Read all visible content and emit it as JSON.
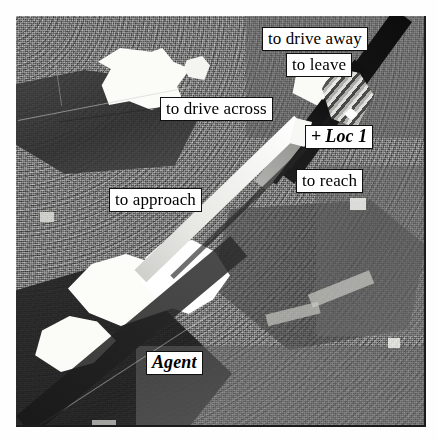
{
  "figure": {
    "kind": "annotated-aerial-photograph",
    "photo_alt": "Aerial photograph of fields and roads with bright and dark patches"
  },
  "annotations": [
    {
      "id": "to-drive-away",
      "label": "to drive away",
      "x": 262,
      "y": 27,
      "style": "plain"
    },
    {
      "id": "to-leave",
      "label": "to leave",
      "x": 286,
      "y": 53,
      "style": "plain"
    },
    {
      "id": "to-drive-across",
      "label": "to drive across",
      "x": 160,
      "y": 97,
      "style": "plain"
    },
    {
      "id": "loc-1",
      "label": "Loc 1",
      "prefix": "+",
      "x": 305,
      "y": 125,
      "style": "bold-italic"
    },
    {
      "id": "to-reach",
      "label": "to reach",
      "x": 296,
      "y": 169,
      "style": "plain"
    },
    {
      "id": "to-approach",
      "label": "to approach",
      "x": 109,
      "y": 188,
      "style": "plain"
    },
    {
      "id": "agent",
      "label": "Agent",
      "x": 146,
      "y": 351,
      "style": "bold-italic"
    }
  ],
  "colors": {
    "label_fill": "#ffffff",
    "label_border": "#101010",
    "label_text": "#000000",
    "photo_base": "#727272",
    "band_bright": "#f2f2ef",
    "band_mid": "#9a9a96",
    "band_dark": "#121212"
  },
  "bands": [
    {
      "id": "approach-band",
      "name": "approach-trajectory-band",
      "tone": "bright"
    },
    {
      "id": "reach-band",
      "name": "reach-trajectory-band",
      "tone": "mid"
    },
    {
      "id": "leave-band",
      "name": "leave-trajectory-band",
      "tone": "dark"
    },
    {
      "id": "drive-away-band",
      "name": "drive-away-band",
      "tone": "dark"
    }
  ]
}
